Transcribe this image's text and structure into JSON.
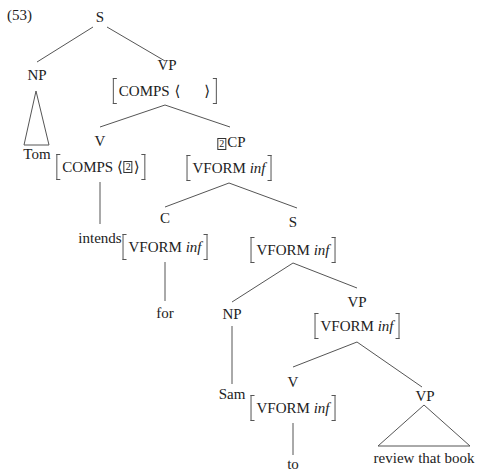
{
  "example_number": "(53)",
  "tree": {
    "root": {
      "label": "S"
    },
    "np_subject": {
      "label": "NP",
      "leaf": "Tom",
      "leaf_style": "triangle"
    },
    "vp_top": {
      "label": "VP",
      "avm": {
        "feature": "COMPS",
        "value_open": "⟨",
        "value_close": "⟩",
        "value": ""
      }
    },
    "verb": {
      "label": "V",
      "avm": {
        "feature": "COMPS",
        "value_open": "⟨",
        "value_close": "⟩",
        "tag": "2"
      },
      "leaf": "intends"
    },
    "cp": {
      "tag": "2",
      "label": "CP",
      "avm": {
        "feature": "VFORM",
        "value": "inf"
      }
    },
    "comp": {
      "label": "C",
      "avm": {
        "feature": "VFORM",
        "value": "inf"
      },
      "leaf": "for"
    },
    "s_embedded": {
      "label": "S",
      "avm": {
        "feature": "VFORM",
        "value": "inf"
      }
    },
    "np_embedded": {
      "label": "NP",
      "leaf": "Sam"
    },
    "vp_embedded": {
      "label": "VP",
      "avm": {
        "feature": "VFORM",
        "value": "inf"
      }
    },
    "v_to": {
      "label": "V",
      "avm": {
        "feature": "VFORM",
        "value": "inf"
      },
      "leaf": "to"
    },
    "vp_lowest": {
      "label": "VP",
      "leaf": "review that book",
      "leaf_style": "triangle"
    }
  }
}
